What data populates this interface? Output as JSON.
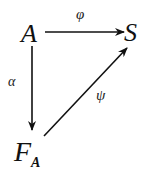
{
  "diagram": {
    "type": "commutative-triangle",
    "nodes": {
      "A": {
        "label": "A"
      },
      "S": {
        "label": "S"
      },
      "FA": {
        "label": "F",
        "subscript": "A"
      }
    },
    "edges": [
      {
        "from": "A",
        "to": "S",
        "label": "φ"
      },
      {
        "from": "A",
        "to": "FA",
        "label": "α"
      },
      {
        "from": "FA",
        "to": "S",
        "label": "ψ"
      }
    ]
  },
  "labels": {
    "phi": "φ",
    "alpha": "α",
    "psi": "ψ"
  }
}
